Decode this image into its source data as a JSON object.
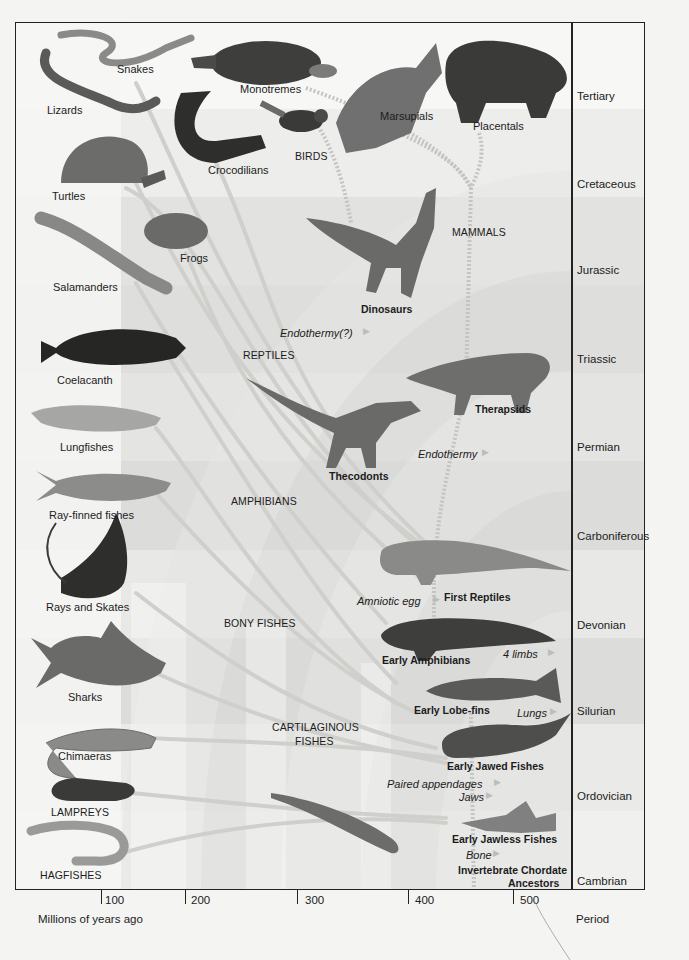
{
  "figure": {
    "type": "phylogenetic-tree",
    "axis": {
      "title": "Millions of years ago",
      "ticks": [
        {
          "label": "100",
          "x": 101
        },
        {
          "label": "200",
          "x": 185
        },
        {
          "label": "300",
          "x": 297
        },
        {
          "label": "400",
          "x": 408
        },
        {
          "label": "500",
          "x": 513
        }
      ]
    },
    "period_column_title": "Period",
    "periods": [
      {
        "name": "Tertiary",
        "y": 97
      },
      {
        "name": "Cretaceous",
        "y": 185
      },
      {
        "name": "Jurassic",
        "y": 271
      },
      {
        "name": "Triassic",
        "y": 360
      },
      {
        "name": "Permian",
        "y": 448
      },
      {
        "name": "Carboniferous",
        "y": 537
      },
      {
        "name": "Devonian",
        "y": 626
      },
      {
        "name": "Silurian",
        "y": 712
      },
      {
        "name": "Ordovician",
        "y": 797
      },
      {
        "name": "Cambrian",
        "y": 882
      }
    ],
    "living_groups": [
      {
        "label": "Snakes",
        "x": 117,
        "y": 69
      },
      {
        "label": "Lizards",
        "x": 47,
        "y": 110
      },
      {
        "label": "Monotremes",
        "x": 240,
        "y": 89
      },
      {
        "label": "Crocodilians",
        "x": 208,
        "y": 170
      },
      {
        "label": "BIRDS",
        "x": 295,
        "y": 157,
        "caps": true
      },
      {
        "label": "Marsupials",
        "x": 380,
        "y": 116
      },
      {
        "label": "Placentals",
        "x": 473,
        "y": 126
      },
      {
        "label": "Turtles",
        "x": 52,
        "y": 196
      },
      {
        "label": "Frogs",
        "x": 180,
        "y": 258
      },
      {
        "label": "Salamanders",
        "x": 53,
        "y": 287
      },
      {
        "label": "Coelacanth",
        "x": 57,
        "y": 380
      },
      {
        "label": "Lungfishes",
        "x": 60,
        "y": 447
      },
      {
        "label": "Ray-finned fishes",
        "x": 49,
        "y": 515
      },
      {
        "label": "Rays and Skates",
        "x": 46,
        "y": 607
      },
      {
        "label": "Sharks",
        "x": 68,
        "y": 697
      },
      {
        "label": "Chimaeras",
        "x": 58,
        "y": 756
      },
      {
        "label": "LAMPREYS",
        "x": 51,
        "y": 813,
        "caps": true
      },
      {
        "label": "HAGFISHES",
        "x": 40,
        "y": 876,
        "caps": true
      }
    ],
    "group_labels": [
      {
        "label": "MAMMALS",
        "x": 452,
        "y": 233
      },
      {
        "label": "REPTILES",
        "x": 243,
        "y": 356
      },
      {
        "label": "AMPHIBIANS",
        "x": 231,
        "y": 502
      },
      {
        "label": "BONY FISHES",
        "x": 224,
        "y": 624
      },
      {
        "label": "CARTILAGINOUS",
        "x": 272,
        "y": 728
      },
      {
        "label": "FISHES",
        "x": 295,
        "y": 742
      }
    ],
    "ancestors": [
      {
        "label": "Dinosaurs",
        "x": 361,
        "y": 310
      },
      {
        "label": "Therapsids",
        "x": 475,
        "y": 410
      },
      {
        "label": "Thecodonts",
        "x": 329,
        "y": 477
      },
      {
        "label": "First Reptiles",
        "x": 444,
        "y": 598
      },
      {
        "label": "Early Amphibians",
        "x": 382,
        "y": 661
      },
      {
        "label": "Early Lobe-fins",
        "x": 414,
        "y": 711
      },
      {
        "label": "Early Jawed Fishes",
        "x": 447,
        "y": 767
      },
      {
        "label": "Early Jawless Fishes",
        "x": 452,
        "y": 840
      },
      {
        "label": "Invertebrate Chordate",
        "x": 458,
        "y": 871
      },
      {
        "label": "Ancestors",
        "x": 508,
        "y": 884
      }
    ],
    "innovations": [
      {
        "label": "Endothermy(?)",
        "x": 280,
        "y": 333
      },
      {
        "label": "Endothermy",
        "x": 418,
        "y": 454
      },
      {
        "label": "Amniotic egg",
        "x": 357,
        "y": 601
      },
      {
        "label": "4 limbs",
        "x": 503,
        "y": 654
      },
      {
        "label": "Lungs",
        "x": 517,
        "y": 713
      },
      {
        "label": "Paired appendages",
        "x": 387,
        "y": 784
      },
      {
        "label": "Jaws",
        "x": 459,
        "y": 797
      },
      {
        "label": "Bone",
        "x": 466,
        "y": 855
      }
    ]
  },
  "colors": {
    "background": "#f4f4f2",
    "band_light": "#f3f3f2",
    "band_dark": "#dcdcda",
    "arc_shade": "#e0e0de",
    "lineage": "#cfcfcc",
    "ink": "#1c1c1c"
  }
}
